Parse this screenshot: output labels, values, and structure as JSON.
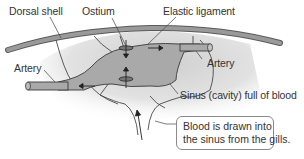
{
  "diagram": {
    "type": "anatomical-diagram",
    "labels": {
      "dorsal_shell": "Dorsal shell",
      "ostium": "Ostium",
      "elastic_ligament": "Elastic ligament",
      "artery_left": "Artery",
      "artery_right": "Artery",
      "sinus": "Sinus (cavity) full of blood"
    },
    "callout": {
      "line1": "Blood is drawn into",
      "line2": "the sinus from the gills."
    },
    "colors": {
      "shell": "#8c8c8c",
      "heart": "#a8a8a8",
      "sinus_fill": "#dcdcdc",
      "outline": "#4a4a4a",
      "text": "#333333",
      "arrow": "#222222"
    }
  }
}
